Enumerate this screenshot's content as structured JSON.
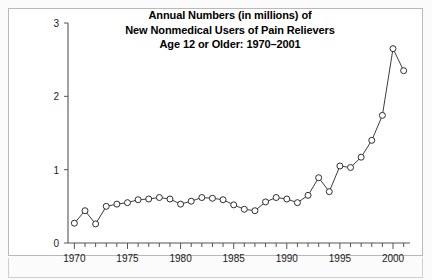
{
  "chart_data": {
    "type": "line",
    "title": "Annual Numbers (in millions) of New Nonmedical Users of Pain Relievers Age 12 or Older: 1970–2001",
    "title_lines": [
      "Annual Numbers (in millions) of",
      "New Nonmedical Users of Pain Relievers",
      "Age 12 or Older: 1970–2001"
    ],
    "xlabel": "",
    "ylabel": "",
    "xlim": [
      1969.4,
      2001.6
    ],
    "ylim": [
      0,
      3
    ],
    "grid": false,
    "legend": false,
    "marker": "open-circle",
    "line_color": "#3c3c3c",
    "marker_fill": "#ffffff",
    "y_ticks": [
      0,
      1,
      2,
      3
    ],
    "y_tick_labels": [
      "0",
      "1",
      "2",
      "3"
    ],
    "x_ticks": [
      1970,
      1975,
      1980,
      1985,
      1990,
      1995,
      2000
    ],
    "x_tick_labels": [
      "1970",
      "1975",
      "1980",
      "1985",
      "1990",
      "1995",
      "2000"
    ],
    "x_minor_tick_step": 1,
    "x": [
      1970,
      1971,
      1972,
      1973,
      1974,
      1975,
      1976,
      1977,
      1978,
      1979,
      1980,
      1981,
      1982,
      1983,
      1984,
      1985,
      1986,
      1987,
      1988,
      1989,
      1990,
      1991,
      1992,
      1993,
      1994,
      1995,
      1996,
      1997,
      1998,
      1999,
      2000,
      2001
    ],
    "values": [
      0.27,
      0.44,
      0.26,
      0.5,
      0.53,
      0.55,
      0.59,
      0.6,
      0.62,
      0.6,
      0.53,
      0.57,
      0.62,
      0.61,
      0.59,
      0.52,
      0.46,
      0.44,
      0.56,
      0.62,
      0.6,
      0.55,
      0.65,
      0.89,
      0.7,
      1.05,
      1.03,
      1.17,
      1.4,
      1.74,
      2.02,
      2.65
    ],
    "series": [
      {
        "name": "New nonmedical users of pain relievers",
        "values": [
          0.27,
          0.44,
          0.26,
          0.5,
          0.53,
          0.55,
          0.59,
          0.6,
          0.62,
          0.6,
          0.53,
          0.57,
          0.62,
          0.61,
          0.59,
          0.52,
          0.46,
          0.44,
          0.56,
          0.62,
          0.6,
          0.55,
          0.65,
          0.89,
          0.7,
          1.05,
          1.03,
          1.17,
          1.4,
          1.74,
          2.65,
          2.35
        ]
      }
    ],
    "points": [
      {
        "year": 1970,
        "value": 0.27
      },
      {
        "year": 1971,
        "value": 0.44
      },
      {
        "year": 1972,
        "value": 0.26
      },
      {
        "year": 1973,
        "value": 0.5
      },
      {
        "year": 1974,
        "value": 0.53
      },
      {
        "year": 1975,
        "value": 0.55
      },
      {
        "year": 1976,
        "value": 0.59
      },
      {
        "year": 1977,
        "value": 0.6
      },
      {
        "year": 1978,
        "value": 0.62
      },
      {
        "year": 1979,
        "value": 0.6
      },
      {
        "year": 1980,
        "value": 0.53
      },
      {
        "year": 1981,
        "value": 0.57
      },
      {
        "year": 1982,
        "value": 0.62
      },
      {
        "year": 1983,
        "value": 0.61
      },
      {
        "year": 1984,
        "value": 0.59
      },
      {
        "year": 1985,
        "value": 0.52
      },
      {
        "year": 1986,
        "value": 0.46
      },
      {
        "year": 1987,
        "value": 0.44
      },
      {
        "year": 1988,
        "value": 0.56
      },
      {
        "year": 1989,
        "value": 0.62
      },
      {
        "year": 1990,
        "value": 0.6
      },
      {
        "year": 1991,
        "value": 0.55
      },
      {
        "year": 1992,
        "value": 0.65
      },
      {
        "year": 1993,
        "value": 0.89
      },
      {
        "year": 1994,
        "value": 0.7
      },
      {
        "year": 1995,
        "value": 1.05
      },
      {
        "year": 1996,
        "value": 1.03
      },
      {
        "year": 1997,
        "value": 1.17
      },
      {
        "year": 1998,
        "value": 1.4
      },
      {
        "year": 1999,
        "value": 1.74
      },
      {
        "year": 2000,
        "value": 2.65
      },
      {
        "year": 2001,
        "value": 2.35
      }
    ]
  }
}
